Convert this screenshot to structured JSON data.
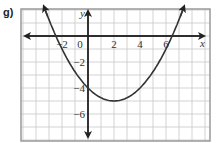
{
  "problem_label": "g)",
  "chart_data": {
    "type": "line",
    "title": "",
    "xlabel": "x",
    "ylabel": "y",
    "xlim": [
      -5.15,
      9.4
    ],
    "ylim": [
      -8.1,
      2.1
    ],
    "grid": true,
    "x_tick_labels": [
      "−2",
      "0",
      "2",
      "4",
      "6"
    ],
    "x_ticks": [
      -2,
      0,
      2,
      4,
      6
    ],
    "y_tick_labels": [
      "−2",
      "−4",
      "−6"
    ],
    "y_ticks": [
      -2,
      -4,
      -6
    ],
    "series": [
      {
        "name": "parabola",
        "equation": "y = 0.25(x − 2)^2 − 5",
        "vertex": [
          2,
          -5
        ],
        "y_intercept": -4,
        "x_intercepts": [
          -2.47,
          6.47
        ],
        "x": [
          -3.4,
          -2,
          0,
          2,
          4,
          6,
          7.4
        ],
        "values": [
          2.29,
          -1,
          -4,
          -5,
          -4,
          -1,
          2.29
        ]
      }
    ],
    "colors": {
      "curve": "#333333",
      "axes": "#222222",
      "grid": "#c8c8c8",
      "frame": "#999999"
    }
  }
}
